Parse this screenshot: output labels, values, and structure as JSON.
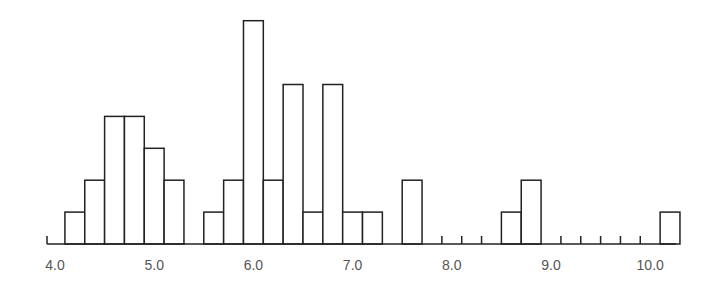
{
  "chart_data": {
    "type": "bar",
    "title": "",
    "xlabel": "",
    "ylabel": "",
    "bin_width": 0.2,
    "x_ticks": [
      "4.0",
      "5.0",
      "6.0",
      "7.0",
      "8.0",
      "9.0",
      "10.0"
    ],
    "bins": [
      {
        "start": 4.1,
        "count": 1
      },
      {
        "start": 4.3,
        "count": 2
      },
      {
        "start": 4.5,
        "count": 4
      },
      {
        "start": 4.7,
        "count": 4
      },
      {
        "start": 4.9,
        "count": 3
      },
      {
        "start": 5.1,
        "count": 2
      },
      {
        "start": 5.3,
        "count": 0
      },
      {
        "start": 5.5,
        "count": 1
      },
      {
        "start": 5.7,
        "count": 2
      },
      {
        "start": 5.9,
        "count": 7
      },
      {
        "start": 6.1,
        "count": 2
      },
      {
        "start": 6.3,
        "count": 5
      },
      {
        "start": 6.5,
        "count": 1
      },
      {
        "start": 6.7,
        "count": 5
      },
      {
        "start": 6.9,
        "count": 1
      },
      {
        "start": 7.1,
        "count": 1
      },
      {
        "start": 7.3,
        "count": 0
      },
      {
        "start": 7.5,
        "count": 2
      },
      {
        "start": 7.7,
        "count": 0
      },
      {
        "start": 7.9,
        "count": 0
      },
      {
        "start": 8.1,
        "count": 0
      },
      {
        "start": 8.3,
        "count": 0
      },
      {
        "start": 8.5,
        "count": 1
      },
      {
        "start": 8.7,
        "count": 2
      },
      {
        "start": 8.9,
        "count": 0
      },
      {
        "start": 9.1,
        "count": 0
      },
      {
        "start": 9.3,
        "count": 0
      },
      {
        "start": 9.5,
        "count": 0
      },
      {
        "start": 9.7,
        "count": 0
      },
      {
        "start": 9.9,
        "count": 0
      },
      {
        "start": 10.1,
        "count": 1
      }
    ],
    "ylim": [
      0,
      7
    ],
    "grid": false,
    "legend": null
  },
  "style": {
    "stroke": "#222222",
    "fill": "#ffffff",
    "label_color": "#555555"
  }
}
